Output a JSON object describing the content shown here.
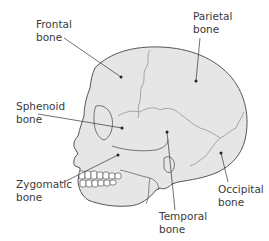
{
  "diagram": {
    "colors": {
      "skull_fill": "#e6e6e6",
      "outline": "#555555",
      "suture": "#8a8a8a",
      "leader": "#333333",
      "text": "#3a3a3a",
      "teeth": "#ffffff"
    },
    "labels": [
      {
        "id": "frontal",
        "text": "Frontal\nbone"
      },
      {
        "id": "parietal",
        "text": "Parietal\nbone"
      },
      {
        "id": "sphenoid",
        "text": "Sphenoid\nbone"
      },
      {
        "id": "zygomatic",
        "text": "Zygomatic\nbone"
      },
      {
        "id": "temporal",
        "text": "Temporal\nbone"
      },
      {
        "id": "occipital",
        "text": "Occipital\nbone"
      }
    ]
  }
}
